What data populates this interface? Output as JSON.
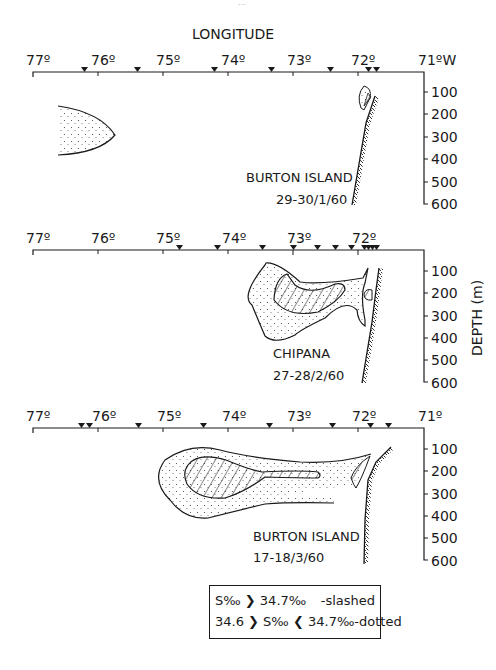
{
  "page_mark": "···",
  "axis_title": "LONGITUDE",
  "depth_axis_title": "DEPTH (m)",
  "longitude_ticks": [
    "77º",
    "76º",
    "75º",
    "74º",
    "73º",
    "72º",
    "71ºW"
  ],
  "longitude_ticks_plain": [
    "77º",
    "76º",
    "75º",
    "74º",
    "73º",
    "72º",
    "71º"
  ],
  "depth_ticks": [
    "100",
    "200",
    "300",
    "400",
    "500",
    "600"
  ],
  "panels": [
    {
      "ship": "BURTON ISLAND",
      "date": "29-30/1/60",
      "stations_deg_w": [
        76.3,
        75.5,
        74.2,
        73.35,
        72.45,
        71.95,
        71.85
      ]
    },
    {
      "ship": "CHIPANA",
      "date": "27-28/2/60",
      "stations_deg_w": [
        74.8,
        74.2,
        73.5,
        73.0,
        72.65,
        72.4,
        72.15,
        71.95,
        71.9,
        71.85,
        71.8
      ]
    },
    {
      "ship": "BURTON ISLAND",
      "date": "17-18/3/60",
      "stations_deg_w": [
        76.2,
        76.15,
        75.4,
        74.4,
        73.4,
        72.4,
        71.85,
        71.6
      ]
    }
  ],
  "legend": {
    "row1_expr": "S‰ ❯ 34.7‰",
    "row1_label": "-slashed",
    "row2_expr": "34.6 ❯ S‰ ❮ 34.7‰",
    "row2_label": "-dotted"
  },
  "colors": {
    "ink": "#1a1a1a",
    "background": "#ffffff"
  }
}
